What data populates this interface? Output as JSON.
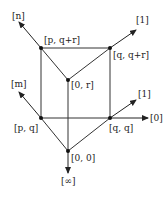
{
  "diagram": {
    "nodes": [
      {
        "id": "p_qr",
        "label": "[p, q+r]",
        "x": 41,
        "y": 48
      },
      {
        "id": "q_qr",
        "label": "[q, q+r]",
        "x": 110,
        "y": 48
      },
      {
        "id": "0_r",
        "label": "[0, r]",
        "x": 68,
        "y": 80
      },
      {
        "id": "p_q",
        "label": "[p, q]",
        "x": 41,
        "y": 118
      },
      {
        "id": "q_q",
        "label": "[q, q]",
        "x": 110,
        "y": 118
      },
      {
        "id": "0_0",
        "label": "[0, 0]",
        "x": 68,
        "y": 151
      }
    ],
    "rays": [
      {
        "label": "[n]"
      },
      {
        "label": "[1]"
      },
      {
        "label": "[m]"
      },
      {
        "label": "[1]"
      },
      {
        "label": "[0]"
      },
      {
        "label": "[∞]"
      }
    ]
  }
}
